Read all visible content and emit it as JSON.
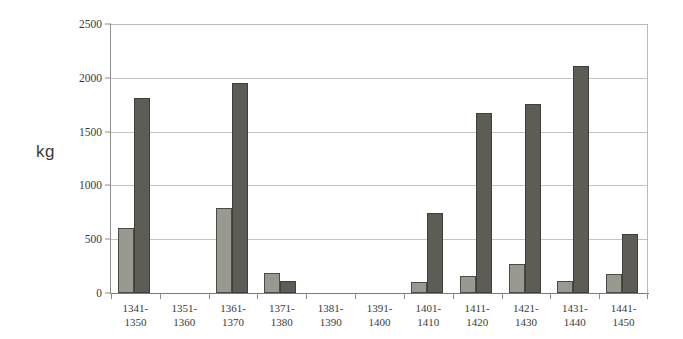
{
  "chart_data": {
    "type": "bar",
    "title": "",
    "subtitle": "",
    "xlabel": "",
    "ylabel": "kg",
    "ylim": [
      0,
      2500
    ],
    "ytick_values": [
      0,
      500,
      1000,
      1500,
      2000,
      2500
    ],
    "ytick_labels": [
      "0",
      "500",
      "1000",
      "1500",
      "2000",
      "2500"
    ],
    "grid": true,
    "legend": null,
    "categories": [
      "1341-1350",
      "1351-1360",
      "1361-1370",
      "1371-1380",
      "1381-1390",
      "1391-1400",
      "1401-1410",
      "1411-1420",
      "1421-1430",
      "1431-1440",
      "1441-1450"
    ],
    "category_lines": [
      [
        "1341-",
        "1350"
      ],
      [
        "1351-",
        "1360"
      ],
      [
        "1361-",
        "1370"
      ],
      [
        "1371-",
        "1380"
      ],
      [
        "1381-",
        "1390"
      ],
      [
        "1391-",
        "1400"
      ],
      [
        "1401-",
        "1410"
      ],
      [
        "1411-",
        "1420"
      ],
      [
        "1421-",
        "1430"
      ],
      [
        "1431-",
        "1440"
      ],
      [
        "1441-",
        "1450"
      ]
    ],
    "series": [
      {
        "name": "series-1",
        "color": "#99998f",
        "values": [
          600,
          0,
          790,
          185,
          0,
          0,
          105,
          155,
          270,
          115,
          175
        ]
      },
      {
        "name": "series-2",
        "color": "#5d5d56",
        "values": [
          1810,
          0,
          1950,
          110,
          0,
          0,
          740,
          1670,
          1760,
          2110,
          545
        ]
      }
    ]
  },
  "colors": {
    "series_light": "#99998f",
    "series_dark": "#5d5d56",
    "bar_outline": "#4a4a46",
    "gridline": "#c4c4c4",
    "axis": "#8c8c8c",
    "text": "#3a3a3a",
    "background": "#ffffff"
  }
}
